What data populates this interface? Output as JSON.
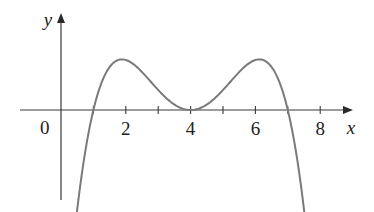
{
  "chart_data": {
    "type": "line",
    "title": "",
    "xlabel": "x",
    "ylabel": "y",
    "origin_label": "0",
    "x_ticks": [
      1,
      2,
      3,
      4,
      5,
      6,
      7,
      8
    ],
    "x_tick_labels": [
      {
        "value": 2,
        "label": "2"
      },
      {
        "value": 4,
        "label": "4"
      },
      {
        "value": 6,
        "label": "6"
      },
      {
        "value": 8,
        "label": "8"
      }
    ],
    "xlim": [
      -1.1,
      9.5
    ],
    "grid": false,
    "legend": null,
    "function_form": "f(x) = -k (x-1)(x-7)(x-4)^2",
    "key_points": [
      {
        "x": 1,
        "y": 0,
        "note": "zero"
      },
      {
        "x": 2,
        "y": "local max",
        "note": "peak"
      },
      {
        "x": 4,
        "y": 0,
        "note": "local min, touches axis"
      },
      {
        "x": 6,
        "y": "local max",
        "note": "peak"
      },
      {
        "x": 7,
        "y": 0,
        "note": "zero"
      }
    ],
    "series": [
      {
        "name": "f(x)",
        "x_range": [
          0.47,
          7.53
        ],
        "samples": 200
      }
    ]
  },
  "layout": {
    "origin_px": [
      61,
      110
    ],
    "px_per_unit_x": 32.4,
    "px_per_unit_y": 2.5,
    "y_axis_top": 13,
    "y_axis_bottom": 200,
    "x_axis_left": 20,
    "x_axis_right": 353,
    "curve_color": "#7a7a7a",
    "axis_color": "#3a3a3a"
  }
}
